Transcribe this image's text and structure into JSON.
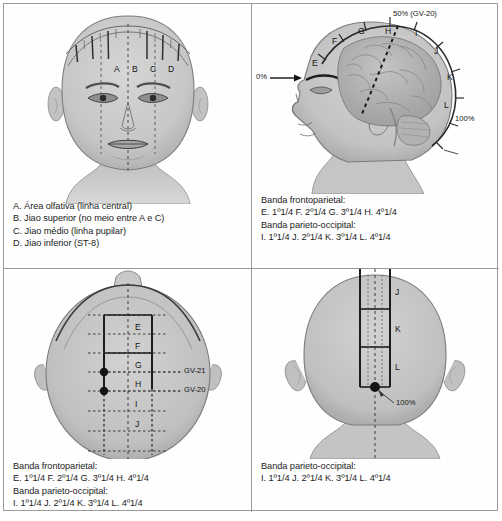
{
  "figure": {
    "colors": {
      "frame_border": "#9a9a9a",
      "skin": "#c9c9c9",
      "skin_shadow": "#b0b0b0",
      "brain": "#b8b8b8",
      "line": "#2a2a2a",
      "text": "#1c1c1c"
    }
  },
  "quadrant1": {
    "name": "Vista frontal do rosto",
    "diagram_labels": [
      "A",
      "B",
      "C",
      "D"
    ],
    "caption": [
      "A. Área olfativa (linha central)",
      "B. Jiao superior (no meio entre A e C)",
      "C. Jiao médio (linha pupilar)",
      "D. Jiao inferior (ST-8)"
    ]
  },
  "quadrant2": {
    "name": "Vista lateral da cabeça com encéfalo",
    "diagram_labels": [
      "E",
      "F",
      "G",
      "H",
      "I",
      "J",
      "K",
      "L"
    ],
    "markers": {
      "start_percent": "0%",
      "mid_percent": "50% (GV-20)",
      "end_percent": "100%"
    },
    "caption": [
      "Banda frontoparietal:",
      "E. 1º1/4 F. 2º1/4 G. 3º1/4 H. 4º1/4",
      "Banda parieto-occipital:",
      "I. 1º1/4 J. 2º1/4 K. 3º1/4 L. 4º1/4"
    ]
  },
  "quadrant3": {
    "name": "Vista superior da cabeça",
    "diagram_labels": [
      "E",
      "F",
      "G",
      "H",
      "I",
      "J"
    ],
    "point_callouts": [
      "GV-21",
      "GV-20"
    ],
    "caption": [
      "Banda frontoparietal:",
      "E. 1º1/4 F. 2º1/4 G. 3º1/4 H. 4º1/4",
      "Banda parieto-occipital:",
      "I. 1º1/4 J. 2º1/4 K. 3º1/4 L. 4º1/4"
    ]
  },
  "quadrant4": {
    "name": "Vista posterior da cabeça",
    "diagram_labels": [
      "J",
      "K",
      "L"
    ],
    "markers": {
      "end_percent": "100%"
    },
    "caption": [
      "Banda parieto-occipital:",
      "I. 1º1/4 J. 2º1/4 K. 3º1/4 L. 4º1/4"
    ]
  }
}
